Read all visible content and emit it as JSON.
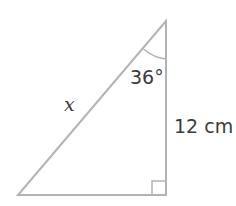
{
  "diagram": {
    "type": "right-triangle",
    "stroke_color": "#b3b3b3",
    "text_color": "#3a3a3a",
    "vertices": {
      "top": [
        166,
        21
      ],
      "bottom_right": [
        166,
        195
      ],
      "bottom_left": [
        18,
        195
      ]
    },
    "labels": {
      "angle": "36°",
      "hypotenuse": "x",
      "vertical_side": "12 cm"
    },
    "right_angle_marker": true
  }
}
